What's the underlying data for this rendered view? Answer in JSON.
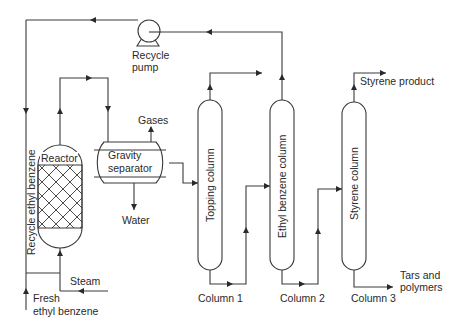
{
  "diagram": {
    "type": "process-flow",
    "labels": {
      "recycle_pump_1": "Recycle",
      "recycle_pump_2": "pump",
      "recycle_ethyl_benzene": "Recycle ethyl benzene",
      "reactor": "Reactor",
      "gravity_separator_1": "Gravity",
      "gravity_separator_2": "separator",
      "gases": "Gases",
      "water": "Water",
      "steam": "Steam",
      "fresh_eb_1": "Fresh",
      "fresh_eb_2": "ethyl benzene",
      "topping_column": "Topping column",
      "ethyl_benzene_column": "Ethyl benzene column",
      "styrene_column": "Styrene column",
      "column1": "Column 1",
      "column2": "Column 2",
      "column3": "Column 3",
      "styrene_product": "Styrene product",
      "tars_1": "Tars and",
      "tars_2": "polymers"
    },
    "stroke_color": "#3a3a3a"
  }
}
